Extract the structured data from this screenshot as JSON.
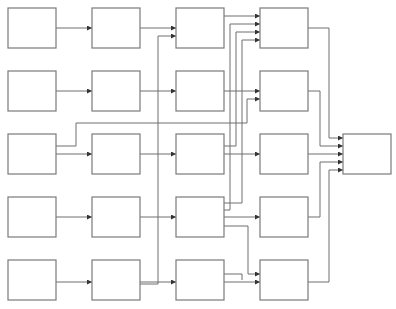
{
  "diagram": {
    "type": "flow-graph",
    "colors": {
      "node_stroke": "#7a7a7a",
      "edge": "#6e6e6e",
      "arrowhead": "#333333",
      "background": "#ffffff"
    },
    "node_size": {
      "w": 48,
      "h": 40
    },
    "nodes": [
      {
        "id": "r0c0",
        "x": 8,
        "y": 8,
        "label": ""
      },
      {
        "id": "r0c1",
        "x": 92,
        "y": 8,
        "label": ""
      },
      {
        "id": "r0c2",
        "x": 176,
        "y": 8,
        "label": ""
      },
      {
        "id": "r0c3",
        "x": 260,
        "y": 8,
        "label": ""
      },
      {
        "id": "r1c0",
        "x": 8,
        "y": 71,
        "label": ""
      },
      {
        "id": "r1c1",
        "x": 92,
        "y": 71,
        "label": ""
      },
      {
        "id": "r1c2",
        "x": 176,
        "y": 71,
        "label": ""
      },
      {
        "id": "r1c3",
        "x": 260,
        "y": 71,
        "label": ""
      },
      {
        "id": "r2c0",
        "x": 8,
        "y": 134,
        "label": ""
      },
      {
        "id": "r2c1",
        "x": 92,
        "y": 134,
        "label": ""
      },
      {
        "id": "r2c2",
        "x": 176,
        "y": 134,
        "label": ""
      },
      {
        "id": "r2c3",
        "x": 260,
        "y": 134,
        "label": ""
      },
      {
        "id": "r3c0",
        "x": 8,
        "y": 197,
        "label": ""
      },
      {
        "id": "r3c1",
        "x": 92,
        "y": 197,
        "label": ""
      },
      {
        "id": "r3c2",
        "x": 176,
        "y": 197,
        "label": ""
      },
      {
        "id": "r3c3",
        "x": 260,
        "y": 197,
        "label": ""
      },
      {
        "id": "r4c0",
        "x": 8,
        "y": 260,
        "label": ""
      },
      {
        "id": "r4c1",
        "x": 92,
        "y": 260,
        "label": ""
      },
      {
        "id": "r4c2",
        "x": 176,
        "y": 260,
        "label": ""
      },
      {
        "id": "r4c3",
        "x": 260,
        "y": 260,
        "label": ""
      },
      {
        "id": "out",
        "x": 343,
        "y": 134,
        "label": ""
      }
    ],
    "edges": [
      {
        "from": "r0c0",
        "to": "r0c1",
        "points": [
          [
            56,
            28
          ],
          [
            92,
            28
          ]
        ]
      },
      {
        "from": "r0c1",
        "to": "r0c2",
        "points": [
          [
            140,
            28
          ],
          [
            176,
            28
          ]
        ]
      },
      {
        "from": "r4c1",
        "to": "r0c2",
        "points": [
          [
            140,
            284
          ],
          [
            158,
            284
          ],
          [
            158,
            36
          ],
          [
            176,
            36
          ]
        ]
      },
      {
        "from": "r0c2",
        "to": "r0c3",
        "points": [
          [
            224,
            16
          ],
          [
            260,
            16
          ]
        ]
      },
      {
        "from": "r3c2",
        "to": "r0c3",
        "points": [
          [
            224,
            210
          ],
          [
            230,
            210
          ],
          [
            230,
            24
          ],
          [
            260,
            24
          ]
        ]
      },
      {
        "from": "r2c2",
        "to": "r0c3",
        "points": [
          [
            224,
            146
          ],
          [
            236,
            146
          ],
          [
            236,
            32
          ],
          [
            260,
            32
          ]
        ]
      },
      {
        "from": "r3c2",
        "to": "r0c3",
        "points": [
          [
            224,
            203
          ],
          [
            242,
            203
          ],
          [
            242,
            40
          ],
          [
            260,
            40
          ]
        ]
      },
      {
        "from": "r1c0",
        "to": "r1c1",
        "points": [
          [
            56,
            91
          ],
          [
            92,
            91
          ]
        ]
      },
      {
        "from": "r1c1",
        "to": "r1c2",
        "points": [
          [
            140,
            91
          ],
          [
            176,
            91
          ]
        ]
      },
      {
        "from": "r1c2",
        "to": "r1c3",
        "points": [
          [
            224,
            91
          ],
          [
            260,
            91
          ]
        ]
      },
      {
        "from": "r2c0",
        "to": "r1c3",
        "points": [
          [
            56,
            146
          ],
          [
            76,
            146
          ],
          [
            76,
            123
          ],
          [
            247,
            123
          ],
          [
            247,
            99
          ],
          [
            260,
            99
          ]
        ]
      },
      {
        "from": "r2c0",
        "to": "r2c1",
        "points": [
          [
            56,
            154
          ],
          [
            92,
            154
          ]
        ]
      },
      {
        "from": "r2c1",
        "to": "r2c2",
        "points": [
          [
            140,
            154
          ],
          [
            176,
            154
          ]
        ]
      },
      {
        "from": "r2c2",
        "to": "r2c3",
        "points": [
          [
            224,
            154
          ],
          [
            260,
            154
          ]
        ]
      },
      {
        "from": "r3c0",
        "to": "r3c1",
        "points": [
          [
            56,
            217
          ],
          [
            92,
            217
          ]
        ]
      },
      {
        "from": "r3c1",
        "to": "r3c2",
        "points": [
          [
            140,
            217
          ],
          [
            176,
            217
          ]
        ]
      },
      {
        "from": "r3c2",
        "to": "r3c3",
        "points": [
          [
            224,
            217
          ],
          [
            260,
            217
          ]
        ]
      },
      {
        "from": "r3c2",
        "to": "r4c3",
        "points": [
          [
            224,
            226
          ],
          [
            248,
            226
          ],
          [
            248,
            274
          ],
          [
            260,
            274
          ]
        ]
      },
      {
        "from": "r4c0",
        "to": "r4c1",
        "points": [
          [
            56,
            282
          ],
          [
            92,
            282
          ]
        ]
      },
      {
        "from": "r4c1",
        "to": "r4c2",
        "points": [
          [
            140,
            282
          ],
          [
            176,
            282
          ]
        ]
      },
      {
        "from": "r4c2",
        "to": "r4c3",
        "points": [
          [
            224,
            274
          ],
          [
            242,
            274
          ],
          [
            242,
            280
          ]
        ]
      },
      {
        "from": "r4c2",
        "to": "r4c3",
        "points": [
          [
            224,
            282
          ],
          [
            260,
            282
          ]
        ]
      },
      {
        "from": "r0c3",
        "to": "out",
        "points": [
          [
            308,
            28
          ],
          [
            329,
            28
          ],
          [
            329,
            138
          ],
          [
            343,
            138
          ]
        ]
      },
      {
        "from": "r1c3",
        "to": "out",
        "points": [
          [
            308,
            91
          ],
          [
            320,
            91
          ],
          [
            320,
            146
          ],
          [
            343,
            146
          ]
        ]
      },
      {
        "from": "r2c3",
        "to": "out",
        "points": [
          [
            308,
            154
          ],
          [
            343,
            154
          ]
        ]
      },
      {
        "from": "r3c3",
        "to": "out",
        "points": [
          [
            308,
            217
          ],
          [
            320,
            217
          ],
          [
            320,
            162
          ],
          [
            343,
            162
          ]
        ]
      },
      {
        "from": "r4c3",
        "to": "out",
        "points": [
          [
            308,
            282
          ],
          [
            329,
            282
          ],
          [
            329,
            170
          ],
          [
            343,
            170
          ]
        ]
      }
    ]
  }
}
